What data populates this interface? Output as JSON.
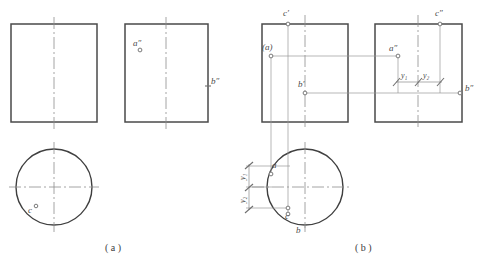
{
  "figure": {
    "title_fragment": "",
    "captions": [
      {
        "id": "caption-a",
        "text": "( a )"
      },
      {
        "id": "caption-b",
        "text": "( b )"
      }
    ]
  },
  "figure_a": {
    "name": "figure-a",
    "front_view": {
      "name": "front-view-rectangle"
    },
    "side_view": {
      "name": "side-view-rectangle",
      "labels": [
        {
          "id": "a-double-prime",
          "text": "a″"
        },
        {
          "id": "b-double-prime",
          "text": "b″"
        }
      ]
    },
    "top_view": {
      "name": "top-view-circle",
      "labels": [
        {
          "id": "c",
          "text": "c"
        }
      ]
    }
  },
  "figure_b": {
    "name": "figure-b",
    "front_view": {
      "name": "front-view-rectangle",
      "labels": [
        {
          "id": "c-prime",
          "text": "c′"
        },
        {
          "id": "a-paren",
          "text": "(a)"
        },
        {
          "id": "b-prime",
          "text": "b′"
        }
      ]
    },
    "side_view": {
      "name": "side-view-rectangle",
      "labels": [
        {
          "id": "c-double-prime",
          "text": "c″"
        },
        {
          "id": "a-double-prime",
          "text": "a″"
        },
        {
          "id": "b-double-prime",
          "text": "b″"
        },
        {
          "id": "y1-side",
          "text": "y₁"
        },
        {
          "id": "y2-side",
          "text": "y₂"
        }
      ]
    },
    "top_view": {
      "name": "top-view-circle",
      "labels": [
        {
          "id": "a",
          "text": "a"
        },
        {
          "id": "b",
          "text": "b"
        },
        {
          "id": "c",
          "text": "c"
        },
        {
          "id": "y1-top",
          "text": "y₁"
        },
        {
          "id": "y2-top",
          "text": "y₂"
        }
      ]
    }
  },
  "colors": {
    "outline": "#4a4a4a",
    "centerline": "#8d8d8d",
    "projection": "#9a9a9a",
    "dimension": "#8a8a8a",
    "text": "#4a4a4a",
    "background": "#ffffff"
  }
}
